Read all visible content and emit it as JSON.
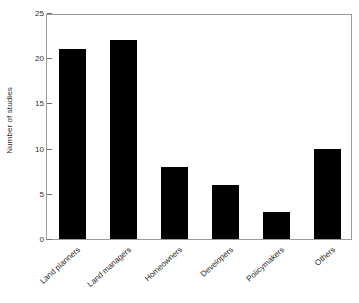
{
  "chart_data": {
    "type": "bar",
    "title": "",
    "xlabel": "",
    "ylabel": "Number of studies",
    "categories": [
      "Land planners",
      "Land managers",
      "Homeowners",
      "Developers",
      "Policymakers",
      "Others"
    ],
    "values": [
      21,
      22,
      8,
      6,
      3,
      10
    ],
    "ylim": [
      0,
      25
    ],
    "yticks": [
      0,
      5,
      10,
      15,
      20,
      25
    ],
    "ytick_labels": [
      "0",
      "5",
      "10",
      "15",
      "20",
      "25"
    ],
    "grid": false,
    "legend": null,
    "bar_color": "#000000",
    "frame_color": "#9a9a9a",
    "text_color": "#2b2b2b",
    "xtick_label_rotation": -42
  }
}
